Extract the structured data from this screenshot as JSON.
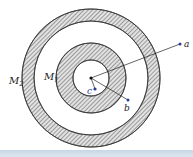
{
  "figure": {
    "labels": {
      "m2": "M",
      "m2_sub": "2",
      "m1": "M",
      "m1_sub": "1",
      "a": "a",
      "b": "b",
      "c": "c"
    },
    "geometry": {
      "center": [
        91,
        78
      ],
      "outer_shell_radii": [
        57,
        69
      ],
      "inner_shell_radii": [
        18,
        35
      ],
      "point_a": [
        180,
        44
      ],
      "point_b": [
        128,
        100
      ],
      "point_c": [
        95,
        89
      ]
    },
    "colors": {
      "hatch": "#6a6a6a",
      "shell_edge": "#333333",
      "point": "#2b3f9a",
      "bottom_bar": "#cfdbea"
    }
  }
}
